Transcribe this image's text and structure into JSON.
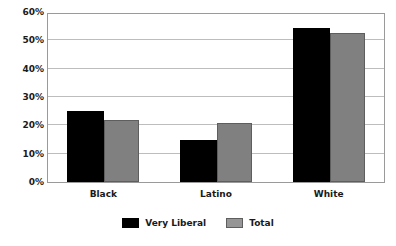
{
  "chart_data": {
    "type": "bar",
    "title": "",
    "subtitle": "",
    "xlabel": "",
    "ylabel": "",
    "categories": [
      "Black",
      "Latino",
      "White"
    ],
    "series": [
      {
        "name": "Very Liberal",
        "color": "#000000",
        "values": [
          25,
          15,
          54.5
        ]
      },
      {
        "name": "Total",
        "color": "#808080",
        "values": [
          22,
          21,
          52.5
        ]
      }
    ],
    "ylim": [
      0,
      60
    ],
    "ytick_values": [
      0,
      10,
      20,
      30,
      40,
      50,
      60
    ],
    "ytick_labels": [
      "0%",
      "10%",
      "20%",
      "30%",
      "40%",
      "50%",
      "60%"
    ],
    "grid": true,
    "grid_axis": "y",
    "legend_position": "bottom-center",
    "plot_border": true,
    "value_suffix": "%"
  }
}
